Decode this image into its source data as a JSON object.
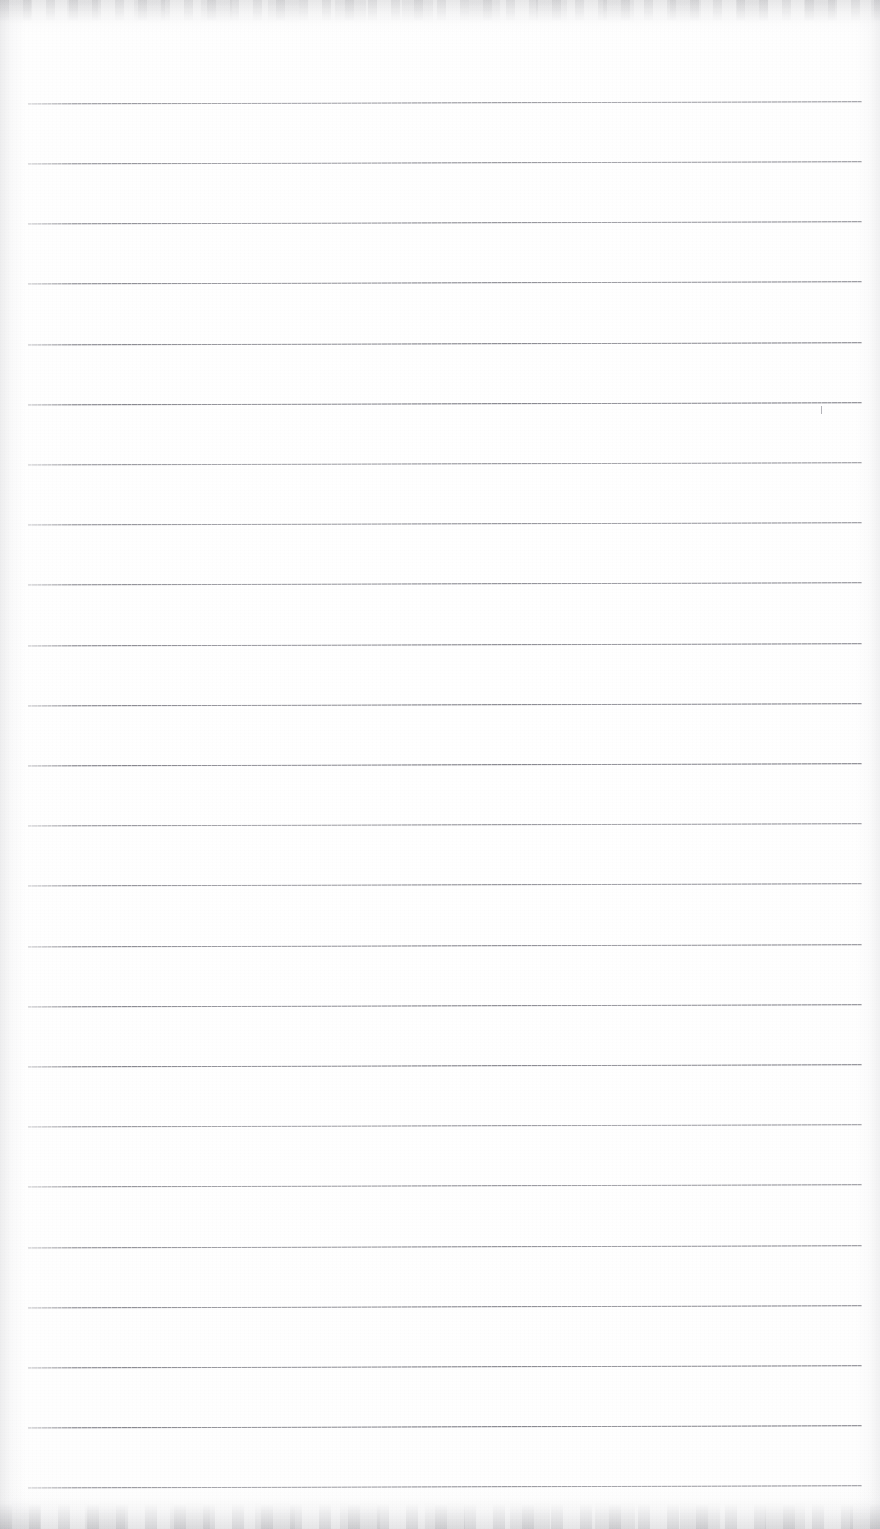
{
  "document": {
    "kind": "scanned-blank-lined-notebook-page",
    "title": "",
    "page_text": "",
    "page_width_px": 880,
    "page_height_px": 1529,
    "paper_color": "#fdfdfd",
    "rule_color": "#7b7b83",
    "edge_shadow_color": "#a8a8ac"
  },
  "ruling": {
    "line_count": 24,
    "left_x_px": 28,
    "right_x_px": 862,
    "first_line_y_px": 103,
    "line_spacing_px": 60.1,
    "line_thickness_px": 2,
    "tilt_deg": -0.15,
    "lines_y_px": [
      103,
      163,
      223,
      283,
      344,
      404,
      464,
      524,
      584,
      645,
      705,
      765,
      825,
      885,
      946,
      1006,
      1066,
      1126,
      1186,
      1247,
      1307,
      1367,
      1427,
      1487
    ]
  },
  "artifacts": {
    "top_edge_band": "faint grey scanner haze across the top edge",
    "bottom_edge_band": "faint mottled grey scanner haze across the bottom edge",
    "left_edge_band": "soft grey vertical gradient at the left margin",
    "right_edge_band": "soft grey vertical gradient at the right margin",
    "stray_tick": {
      "x_px": 821,
      "y_px": 406,
      "height_px": 8
    }
  }
}
